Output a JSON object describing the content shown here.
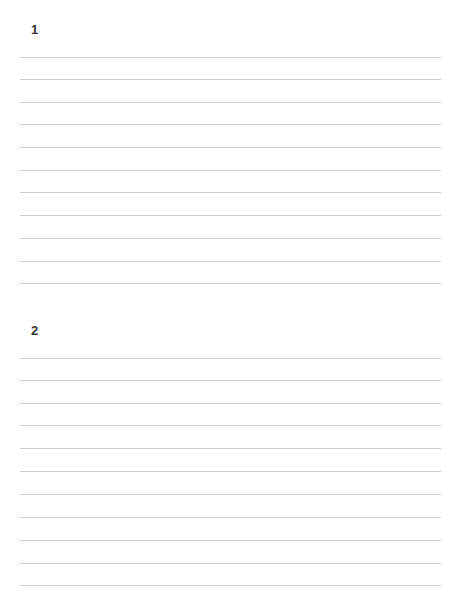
{
  "document": {
    "type": "lined writing sheet",
    "line_color": "#cfcfcf",
    "text_color": "#333333",
    "sections": [
      {
        "number": "1",
        "label_top": 23,
        "lines_top": [
          57,
          79,
          102,
          124,
          147,
          170,
          192,
          215,
          238,
          261,
          283
        ]
      },
      {
        "number": "2",
        "label_top": 324,
        "lines_top": [
          358,
          380,
          403,
          425,
          448,
          471,
          494,
          517,
          540,
          563,
          585
        ]
      }
    ]
  }
}
